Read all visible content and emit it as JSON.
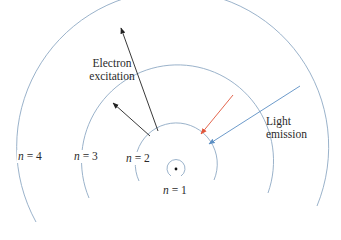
{
  "diagram": {
    "colors": {
      "orbit": "#8fa9c4",
      "excitation_arrow": "#222222",
      "emission_red": "#e0553a",
      "emission_blue": "#5b8fc4",
      "nucleus": "#111111",
      "text": "#2a2a2a"
    },
    "orbits": [
      {
        "n": "1",
        "label_var": "n",
        "label_eq": " = 1"
      },
      {
        "n": "2",
        "label_var": "n",
        "label_eq": " = 2"
      },
      {
        "n": "3",
        "label_var": "n",
        "label_eq": " = 3"
      },
      {
        "n": "4",
        "label_var": "n",
        "label_eq": " = 4"
      }
    ],
    "annotations": {
      "excitation_line1": "Electron",
      "excitation_line2": "excitation",
      "emission_line1": "Light",
      "emission_line2": "emission"
    },
    "arrows": [
      {
        "name": "excitation-2-to-4",
        "from": "n=2",
        "to": "n=4",
        "color": "black"
      },
      {
        "name": "excitation-2-to-3",
        "from": "n=2",
        "to": "n=3",
        "color": "black"
      },
      {
        "name": "emission-3-to-2",
        "from": "n=3",
        "to": "n=2",
        "color": "red"
      },
      {
        "name": "emission-4-to-2",
        "from": "n=4",
        "to": "n=2",
        "color": "blue"
      }
    ]
  }
}
